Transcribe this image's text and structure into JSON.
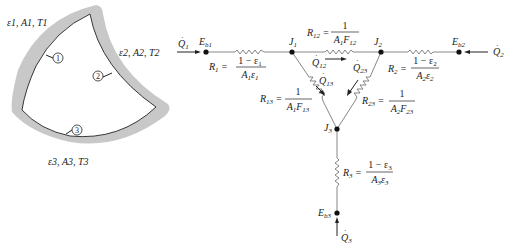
{
  "enclosure": {
    "surface1_props": "ε1, A1, T1",
    "surface2_props": "ε2, A2, T2",
    "surface3_props": "ε3, A3, T3",
    "surface_markers": [
      "1",
      "2",
      "3"
    ],
    "wall_color": "#c8c8c8"
  },
  "network": {
    "nodes": {
      "Eb1": "E_b1",
      "Eb2": "E_b2",
      "Eb3": "E_b3",
      "J1": "J_1",
      "J2": "J_2",
      "J3": "J_3"
    },
    "heat_flows": {
      "Q1": "Q̇1",
      "Q2": "Q̇2",
      "Q3": "Q̇3",
      "Q12": "Q̇12",
      "Q13": "Q̇13",
      "Q23": "Q̇23"
    },
    "resistances": {
      "R1": {
        "label": "R1",
        "numerator": "1 − ε1",
        "denominator": "A1ε1"
      },
      "R2": {
        "label": "R2",
        "numerator": "1 − ε2",
        "denominator": "A2ε2"
      },
      "R3": {
        "label": "R3",
        "numerator": "1 − ε3",
        "denominator": "A3ε3"
      },
      "R12": {
        "label": "R12",
        "numerator": "1",
        "denominator": "A1F12"
      },
      "R13": {
        "label": "R13",
        "numerator": "1",
        "denominator": "A1F13"
      },
      "R23": {
        "label": "R23",
        "numerator": "1",
        "denominator": "A2F23"
      }
    }
  }
}
